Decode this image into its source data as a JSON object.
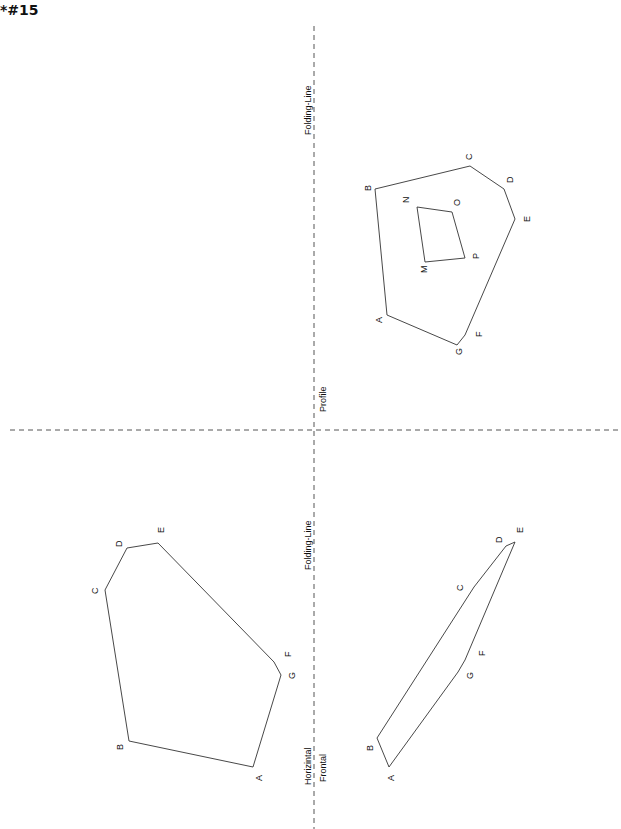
{
  "title": "*#15",
  "labels": {
    "folding_line_top": "Folding-Line",
    "profile": "Profile",
    "folding_line_bottom": "Folding-Line",
    "horizontal": "Horizintal",
    "frontal": "Frontal"
  },
  "profile_view": {
    "outer_vertices": [
      "A",
      "B",
      "C",
      "D",
      "E",
      "F",
      "G"
    ],
    "inner_vertices": [
      "M",
      "N",
      "O",
      "P"
    ]
  },
  "horizontal_view": {
    "vertices": [
      "A",
      "B",
      "C",
      "D",
      "E",
      "F",
      "G"
    ]
  },
  "frontal_view": {
    "vertices": [
      "A",
      "B",
      "C",
      "D",
      "E",
      "F",
      "G"
    ]
  },
  "colors": {
    "line": "#333333",
    "dashed": "#555555"
  }
}
